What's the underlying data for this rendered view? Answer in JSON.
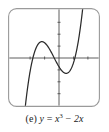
{
  "figure": {
    "label": "(e)",
    "caption_text": "(e) y = x³ − 2x",
    "equation": {
      "lhs": "y",
      "equals": "=",
      "base": "x",
      "exponent": "3",
      "minus": "−",
      "term2": "2x"
    }
  },
  "colors": {
    "frame_stroke": "#9a9a9a",
    "axis_stroke": "#4d4d4d",
    "curve_stroke": "#2b2b2b",
    "background": "#ffffff",
    "caption_text": "#1a1a1a"
  },
  "chart_data": {
    "type": "line",
    "xlabel": "x",
    "ylabel": "y",
    "xlim": [
      -3.1,
      3.1
    ],
    "ylim": [
      -3.4,
      3.4
    ],
    "grid": false,
    "legend": "none",
    "axes": {
      "x_axis_visible": true,
      "y_axis_visible": true,
      "origin": [
        0,
        0
      ],
      "x_ticks": [
        -2,
        -1,
        1,
        2
      ],
      "y_ticks": [
        -3,
        -2,
        -1,
        1,
        2,
        3
      ],
      "tick_labels_shown": false,
      "tick_length_px": 3
    },
    "series": [
      {
        "name": "y = x³ − 2x",
        "expression": "x^3 - 2*x",
        "roots": [
          -1.414,
          0,
          1.414
        ],
        "local_max": {
          "x": -0.816,
          "y": 1.089
        },
        "local_min": {
          "x": 0.816,
          "y": -1.089
        },
        "x": [
          -2.05,
          -1.95,
          -1.85,
          -1.75,
          -1.65,
          -1.55,
          -1.45,
          -1.35,
          -1.25,
          -1.15,
          -1.05,
          -0.95,
          -0.85,
          -0.75,
          -0.65,
          -0.55,
          -0.45,
          -0.35,
          -0.25,
          -0.15,
          -0.05,
          0.05,
          0.15,
          0.25,
          0.35,
          0.45,
          0.55,
          0.65,
          0.75,
          0.85,
          0.95,
          1.05,
          1.15,
          1.25,
          1.35,
          1.45,
          1.55,
          1.65,
          1.75,
          1.85,
          1.95,
          2.05
        ],
        "y": [
          -4.51,
          -3.51,
          -2.63,
          -1.86,
          -1.19,
          -0.62,
          -0.15,
          0.24,
          0.55,
          0.78,
          0.94,
          1.04,
          1.09,
          1.08,
          1.03,
          0.93,
          0.81,
          0.66,
          0.48,
          0.3,
          0.1,
          -0.1,
          -0.3,
          -0.48,
          -0.66,
          -0.81,
          -0.93,
          -1.03,
          -1.08,
          -1.09,
          -1.04,
          -0.94,
          -0.78,
          -0.55,
          -0.24,
          0.15,
          0.62,
          1.19,
          1.86,
          2.63,
          3.51,
          4.51
        ]
      }
    ]
  }
}
